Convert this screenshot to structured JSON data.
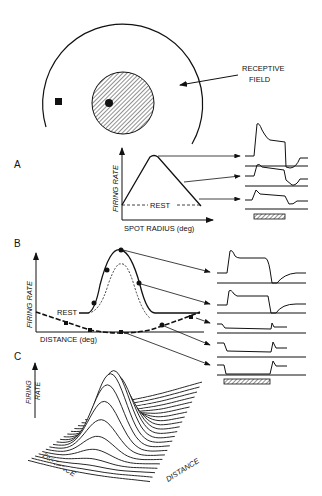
{
  "figure": {
    "top": {
      "label_receptive_field_line1": "RECEPTIVE",
      "label_receptive_field_line2": "FIELD"
    },
    "panel_a": {
      "letter": "A",
      "ylabel": "FIRING RATE",
      "xlabel": "SPOT RADIUS (deg)",
      "rest_label": "REST"
    },
    "panel_b": {
      "letter": "B",
      "ylabel": "FIRING RATE",
      "xlabel": "DISTANCE (deg)",
      "rest_label": "REST"
    },
    "panel_c": {
      "letter": "C",
      "ylabel_line1": "FIRING",
      "ylabel_line2": "RATE",
      "xlabel_left": "DISTANCE",
      "xlabel_right": "DISTANCE"
    }
  },
  "chart_data": [
    {
      "type": "line",
      "title": "A",
      "xlabel": "SPOT RADIUS (deg)",
      "ylabel": "FIRING RATE",
      "annotations": [
        "REST"
      ],
      "x": [
        0,
        0.3,
        1.0
      ],
      "values": [
        0,
        1,
        0
      ],
      "notes": "Area-summation curve: rises from rest to peak, then falls back to rest. Three arrows map points on curve to spike-rate traces (peak, descending, near rest)."
    },
    {
      "type": "line",
      "title": "B",
      "xlabel": "DISTANCE (deg)",
      "ylabel": "FIRING RATE",
      "annotations": [
        "REST"
      ],
      "series": [
        {
          "name": "response to spot (solid)",
          "shape": "gaussian peak above rest"
        },
        {
          "name": "center (dotted)",
          "shape": "narrower gaussian"
        },
        {
          "name": "surround (dashed)",
          "shape": "broad inverted gaussian below rest"
        }
      ],
      "notes": "Five arrows map points to traces: two excitatory, three suppressive."
    },
    {
      "type": "surface",
      "title": "C",
      "xlabel": "DISTANCE",
      "ylabel": "DISTANCE",
      "zlabel": "FIRING RATE",
      "notes": "3D mexican-hat receptive field profile drawn as stacked line traces."
    }
  ]
}
